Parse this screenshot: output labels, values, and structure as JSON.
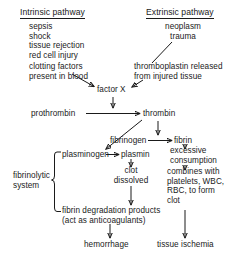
{
  "diagram": {
    "type": "flowchart",
    "stroke_color": "#1a1a1a",
    "background_color": "#ffffff"
  },
  "nodes": {
    "intrinsic_header": "Intrinsic pathway",
    "intrinsic_causes": "sepsis\nshock\ntissue rejection\nred cell injury",
    "intrinsic_factors": "clotting factors\npresent in blood",
    "extrinsic_header": "Extrinsic pathway",
    "extrinsic_causes": "neoplasm\ntrauma",
    "thromboplastin": "thromboplastin released\nfrom injured tissue",
    "factor_x": "factor X",
    "prothrombin": "prothrombin",
    "thrombin": "thrombin",
    "fibrinogen": "fibrinogen",
    "fibrin": "fibrin",
    "excessive_consumption": "excessive\nconsumption",
    "combines_with": "combines with\nplatelets, WBC,\nRBC, to form\nclot",
    "plasminogen": "plasminogen",
    "plasmin": "plasmin",
    "clot_dissolved": "clot\ndissolved",
    "fibrinolytic_system": "fibrinolytic\nsystem",
    "fdp": "fibrin degradation products\n(act as anticoagulants)",
    "hemorrhage": "hemorrhage",
    "tissue_ischemia": "tissue ischemia"
  },
  "edges": [
    {
      "from": "intrinsic_factors",
      "to": "factor_x"
    },
    {
      "from": "extrinsic_causes",
      "to": "thromboplastin"
    },
    {
      "from": "thromboplastin",
      "to": "factor_x"
    },
    {
      "from": "factor_x",
      "to": "prothrombin_thrombin_line"
    },
    {
      "from": "prothrombin",
      "to": "thrombin"
    },
    {
      "from": "thrombin",
      "to": "plasminogen"
    },
    {
      "from": "thrombin",
      "to": "fibrinogen_fibrin_line"
    },
    {
      "from": "fibrinogen",
      "to": "fibrin"
    },
    {
      "from": "plasminogen",
      "to": "plasmin"
    },
    {
      "from": "plasmin",
      "to": "clot_dissolved"
    },
    {
      "from": "clot_dissolved",
      "to": "fdp"
    },
    {
      "from": "fibrin",
      "to": "excessive_consumption"
    },
    {
      "from": "excessive_consumption",
      "to": "combines_with"
    },
    {
      "from": "combines_with",
      "to": "tissue_ischemia"
    },
    {
      "from": "fdp",
      "to": "hemorrhage"
    },
    {
      "from": "fibrinolytic_system",
      "to": "brace_plasminogen_fdp"
    }
  ]
}
